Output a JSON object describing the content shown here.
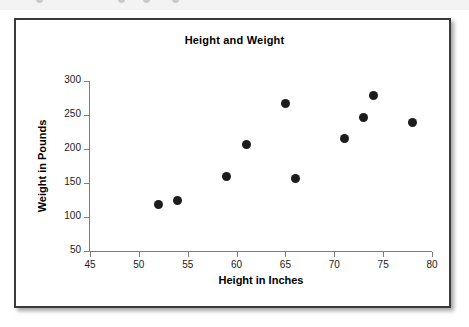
{
  "figure": {
    "title": "Height and Weight",
    "frame_color": "#3a3a3a",
    "background": "#ffffff"
  },
  "artifact": {
    "description": "partially cropped row of markers above the figure"
  },
  "chart_data": {
    "type": "scatter",
    "title": "Height and Weight",
    "xlabel": "Height in Inches",
    "ylabel": "Weight in Pounds",
    "xlim": [
      45,
      80
    ],
    "ylim": [
      50,
      300
    ],
    "xticks": [
      45,
      50,
      55,
      60,
      65,
      70,
      75,
      80
    ],
    "yticks": [
      50,
      100,
      150,
      200,
      250,
      300
    ],
    "grid": false,
    "legend": null,
    "marker_color": "#1c1c1c",
    "points": [
      {
        "x": 52,
        "y": 119
      },
      {
        "x": 54,
        "y": 125
      },
      {
        "x": 59,
        "y": 159
      },
      {
        "x": 61,
        "y": 207
      },
      {
        "x": 65,
        "y": 267
      },
      {
        "x": 66,
        "y": 156
      },
      {
        "x": 71,
        "y": 216
      },
      {
        "x": 73,
        "y": 247
      },
      {
        "x": 74,
        "y": 279
      },
      {
        "x": 78,
        "y": 239
      }
    ]
  }
}
